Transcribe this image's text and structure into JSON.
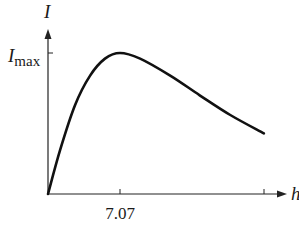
{
  "chart_data": {
    "type": "line",
    "title": "",
    "xlabel": "h",
    "ylabel": "I",
    "y_tick_labels": [
      {
        "value": 1.0,
        "label_main": "I",
        "label_sub": "max"
      }
    ],
    "x_tick_labels": [
      {
        "value": 7.07,
        "label": "7.07"
      }
    ],
    "x_ticks": [
      7.07,
      21.2
    ],
    "grid": false,
    "legend": null,
    "xlim": [
      0,
      23.3
    ],
    "ylim": [
      0,
      1.6
    ],
    "series": [
      {
        "name": "I",
        "color": "#111111",
        "x": [
          0,
          1.18,
          2.65,
          4.13,
          5.6,
          7.07,
          9.04,
          12.0,
          14.9,
          17.9,
          21.2
        ],
        "y": [
          0,
          0.31,
          0.63,
          0.84,
          0.96,
          1.0,
          0.96,
          0.84,
          0.7,
          0.56,
          0.43
        ]
      }
    ],
    "annotations": []
  },
  "labels": {
    "y_axis": "I",
    "y_max_main": "I",
    "y_max_sub": "max",
    "x_axis": "h",
    "x_tick": "7.07"
  },
  "colors": {
    "axis": "#222222",
    "curve": "#111111"
  }
}
